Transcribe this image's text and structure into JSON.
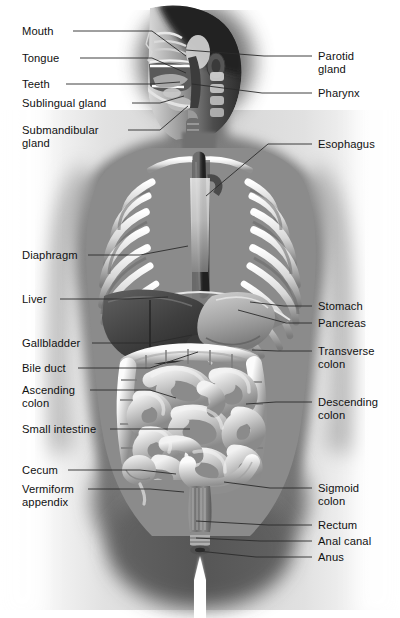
{
  "figure": {
    "style": "grayscale medical illustration",
    "background_color": "#ffffff",
    "label_color": "#111111",
    "leader_line_color": "#2b2b2b",
    "width": 400,
    "height": 618
  },
  "labels_left": [
    {
      "id": "mouth",
      "text": "Mouth",
      "x": 22,
      "y": 25,
      "line": [
        [
          73,
          31
        ],
        [
          152,
          31
        ],
        [
          186,
          56
        ]
      ]
    },
    {
      "id": "tongue",
      "text": "Tongue",
      "x": 22,
      "y": 52,
      "line": [
        [
          80,
          58
        ],
        [
          152,
          58
        ],
        [
          186,
          73
        ]
      ]
    },
    {
      "id": "teeth",
      "text": "Teeth",
      "x": 22,
      "y": 78,
      "line": [
        [
          66,
          84
        ],
        [
          152,
          84
        ],
        [
          180,
          82
        ]
      ]
    },
    {
      "id": "sublingual-gland",
      "text": "Sublingual gland",
      "x": 22,
      "y": 97,
      "line": [
        [
          132,
          103
        ],
        [
          160,
          103
        ],
        [
          184,
          96
        ]
      ]
    },
    {
      "id": "submandibular-gland",
      "text": "Submandibular\ngland",
      "x": 22,
      "y": 124,
      "line": [
        [
          128,
          130
        ],
        [
          160,
          130
        ],
        [
          188,
          106
        ]
      ]
    },
    {
      "id": "diaphragm",
      "text": "Diaphragm",
      "x": 22,
      "y": 249,
      "line": [
        [
          88,
          255
        ],
        [
          140,
          255
        ],
        [
          188,
          246
        ]
      ]
    },
    {
      "id": "liver",
      "text": "Liver",
      "x": 22,
      "y": 293,
      "line": [
        [
          60,
          299
        ],
        [
          130,
          299
        ],
        [
          168,
          297
        ]
      ]
    },
    {
      "id": "gallbladder",
      "text": "Gallbladder",
      "x": 22,
      "y": 337,
      "line": [
        [
          92,
          343
        ],
        [
          152,
          343
        ],
        [
          192,
          335
        ]
      ]
    },
    {
      "id": "bile-duct",
      "text": "Bile duct",
      "x": 22,
      "y": 362,
      "line": [
        [
          78,
          368
        ],
        [
          150,
          368
        ],
        [
          198,
          352
        ]
      ]
    },
    {
      "id": "ascending-colon",
      "text": "Ascending\ncolon",
      "x": 22,
      "y": 384,
      "line": [
        [
          90,
          390
        ],
        [
          150,
          390
        ],
        [
          176,
          398
        ]
      ]
    },
    {
      "id": "small-intestine",
      "text": "Small intestine",
      "x": 22,
      "y": 423,
      "line": [
        [
          110,
          429
        ],
        [
          150,
          429
        ],
        [
          190,
          429
        ]
      ]
    },
    {
      "id": "cecum",
      "text": "Cecum",
      "x": 22,
      "y": 464,
      "line": [
        [
          68,
          470
        ],
        [
          140,
          470
        ],
        [
          176,
          474
        ]
      ]
    },
    {
      "id": "vermiform-appendix",
      "text": "Vermiform\nappendix",
      "x": 22,
      "y": 483,
      "line": [
        [
          88,
          489
        ],
        [
          150,
          489
        ],
        [
          184,
          492
        ]
      ]
    }
  ],
  "labels_right": [
    {
      "id": "parotid-gland",
      "text": "Parotid\ngland",
      "x": 318,
      "y": 50,
      "line": [
        [
          312,
          56
        ],
        [
          264,
          56
        ],
        [
          186,
          50
        ]
      ]
    },
    {
      "id": "pharynx",
      "text": "Pharynx",
      "x": 318,
      "y": 87,
      "line": [
        [
          312,
          93
        ],
        [
          262,
          93
        ],
        [
          192,
          84
        ]
      ]
    },
    {
      "id": "esophagus",
      "text": "Esophagus",
      "x": 318,
      "y": 138,
      "line": [
        [
          312,
          144
        ],
        [
          268,
          144
        ],
        [
          206,
          196
        ]
      ]
    },
    {
      "id": "stomach",
      "text": "Stomach",
      "x": 318,
      "y": 300,
      "line": [
        [
          312,
          306
        ],
        [
          284,
          306
        ],
        [
          250,
          302
        ]
      ]
    },
    {
      "id": "pancreas",
      "text": "Pancreas",
      "x": 318,
      "y": 317,
      "line": [
        [
          312,
          323
        ],
        [
          286,
          323
        ],
        [
          238,
          310
        ]
      ]
    },
    {
      "id": "transverse-colon",
      "text": "Transverse\ncolon",
      "x": 318,
      "y": 345,
      "line": [
        [
          312,
          351
        ],
        [
          278,
          351
        ],
        [
          252,
          350
        ]
      ]
    },
    {
      "id": "descending-colon",
      "text": "Descending\ncolon",
      "x": 318,
      "y": 396,
      "line": [
        [
          312,
          402
        ],
        [
          276,
          402
        ],
        [
          246,
          404
        ]
      ]
    },
    {
      "id": "sigmoid-colon",
      "text": "Sigmoid\ncolon",
      "x": 318,
      "y": 482,
      "line": [
        [
          312,
          488
        ],
        [
          270,
          488
        ],
        [
          224,
          482
        ]
      ]
    },
    {
      "id": "rectum",
      "text": "Rectum",
      "x": 318,
      "y": 519,
      "line": [
        [
          312,
          525
        ],
        [
          268,
          525
        ],
        [
          196,
          521
        ]
      ]
    },
    {
      "id": "anal-canal",
      "text": "Anal canal",
      "x": 318,
      "y": 535,
      "line": [
        [
          312,
          541
        ],
        [
          260,
          541
        ],
        [
          196,
          538
        ]
      ]
    },
    {
      "id": "anus",
      "text": "Anus",
      "x": 318,
      "y": 551,
      "line": [
        [
          312,
          557
        ],
        [
          256,
          557
        ],
        [
          198,
          551
        ]
      ]
    }
  ]
}
